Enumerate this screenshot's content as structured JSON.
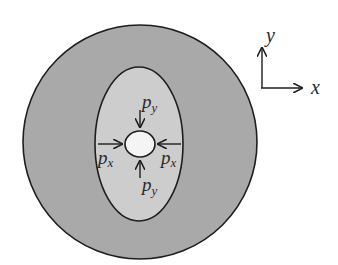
{
  "diagram": {
    "colors": {
      "background": "#ffffff",
      "outer_region": "#a9a9a9",
      "inner_ellipse": "#cdcdcd",
      "hole": "#f4f4f4",
      "stroke": "#1e1e1e"
    },
    "labels": {
      "py_top": "p",
      "py_top_sub": "y",
      "py_bottom": "p",
      "py_bottom_sub": "y",
      "px_left": "p",
      "px_left_sub": "x",
      "px_right": "p",
      "px_right_sub": "x"
    },
    "axes": {
      "x_label": "x",
      "y_label": "y"
    }
  }
}
